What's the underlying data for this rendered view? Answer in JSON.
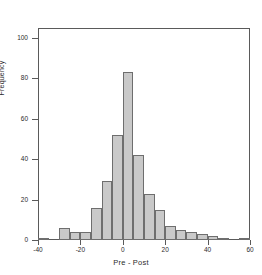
{
  "chart_data": {
    "type": "bar",
    "title": "",
    "subtitle": "",
    "xlabel": "Pre - Post",
    "ylabel": "Frequency",
    "xlim": [
      -40,
      60
    ],
    "ylim": [
      0,
      105
    ],
    "bin_width": 5,
    "grid": false,
    "legend": null,
    "bar_fill_color": "#c9c9c9",
    "bar_edge_color": "#6e6e6e",
    "axis_color": "#5a5a5a",
    "x_ticks": [
      -40,
      -20,
      0,
      20,
      40,
      60
    ],
    "x_tick_labels": [
      "-40",
      "-20",
      "0",
      "20",
      "40",
      "60"
    ],
    "y_ticks": [
      0,
      20,
      40,
      60,
      80,
      100
    ],
    "y_tick_labels": [
      "0",
      "20",
      "40",
      "60",
      "80",
      "100"
    ],
    "categories": [
      "-40",
      "-35",
      "-30",
      "-25",
      "-20",
      "-15",
      "-10",
      "-5",
      "0",
      "5",
      "10",
      "15",
      "20",
      "25",
      "30",
      "35",
      "40",
      "45",
      "50",
      "55"
    ],
    "bin_starts": [
      -40,
      -35,
      -30,
      -25,
      -20,
      -15,
      -10,
      -5,
      0,
      5,
      10,
      15,
      20,
      25,
      30,
      35,
      40,
      45,
      50,
      55
    ],
    "values": [
      1,
      0,
      6,
      4,
      4,
      16,
      29,
      52,
      83,
      42,
      23,
      15,
      7,
      5,
      4,
      3,
      2,
      1,
      0,
      1
    ]
  }
}
